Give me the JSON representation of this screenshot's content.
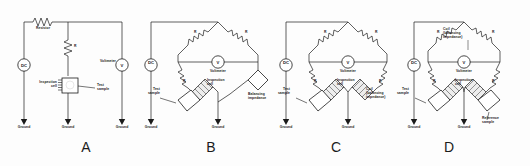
{
  "figure": {
    "ink_color": "#1a1a1a",
    "background": "#fdfdfd"
  },
  "labels": {
    "resistor": "Resistor",
    "r": "R",
    "voltmeter": "Voltmeter",
    "dc": "DC",
    "v": "V",
    "ground": "Ground",
    "inspection_cell": "Inspection\ncell",
    "test_sample": "Test\nsample",
    "balancing_impedance": "Balancing\nimpedance",
    "coil_balancing_impedance": "Coil\n(balancing\nimpedance)",
    "reference_sample": "Reference\nsample"
  },
  "panels": [
    {
      "letter": "A",
      "name": "single-cell-series-circuit",
      "components": [
        "DC",
        "Resistor",
        "R",
        "Voltmeter",
        "Inspection cell",
        "Test sample",
        "Ground"
      ],
      "ground_count": 3
    },
    {
      "letter": "B",
      "name": "bridge-with-balancing-impedance",
      "components": [
        "DC",
        "R",
        "R",
        "R",
        "Voltmeter",
        "Inspection cell",
        "Test sample",
        "Balancing impedance",
        "Ground"
      ],
      "ground_count": 3
    },
    {
      "letter": "C",
      "name": "bridge-with-balancing-coil",
      "components": [
        "DC",
        "R",
        "R",
        "R",
        "R",
        "Voltmeter",
        "Inspection cell",
        "Test sample",
        "Coil (balancing impedance)",
        "Ground"
      ],
      "ground_count": 3
    },
    {
      "letter": "D",
      "name": "bridge-with-reference-sample",
      "components": [
        "DC",
        "R",
        "R",
        "R",
        "R",
        "Coil (balancing impedance)",
        "Voltmeter",
        "Inspection cell",
        "Test sample",
        "Reference sample",
        "Ground"
      ],
      "ground_count": 3
    }
  ]
}
